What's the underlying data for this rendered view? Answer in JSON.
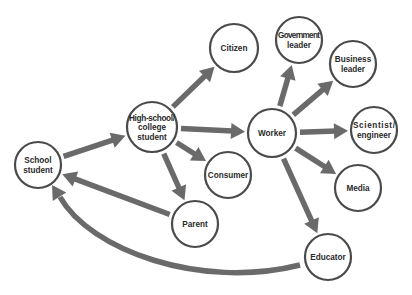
{
  "diagram": {
    "title": "",
    "colors": {
      "arrow": "#6a6a6a",
      "node_stroke": "#4a4a4a",
      "node_fill": "#ffffff",
      "text": "#2a2a2a"
    },
    "nodes": [
      {
        "id": "school_student",
        "lines": [
          "School",
          "student"
        ],
        "cx": 38,
        "cy": 165,
        "r": 23
      },
      {
        "id": "hs_college_student",
        "lines": [
          "High-school/",
          "college",
          "student"
        ],
        "cx": 152,
        "cy": 127,
        "r": 25
      },
      {
        "id": "citizen",
        "lines": [
          "Citizen"
        ],
        "cx": 234,
        "cy": 48,
        "r": 24
      },
      {
        "id": "government_leader",
        "lines": [
          "Government",
          "leader"
        ],
        "cx": 299,
        "cy": 40,
        "r": 23
      },
      {
        "id": "business_leader",
        "lines": [
          "Business",
          "leader"
        ],
        "cx": 353,
        "cy": 64,
        "r": 23
      },
      {
        "id": "worker",
        "lines": [
          "Worker"
        ],
        "cx": 272,
        "cy": 133,
        "r": 24
      },
      {
        "id": "scientist_engineer",
        "lines": [
          "Scientist/",
          "engineer"
        ],
        "cx": 374,
        "cy": 130,
        "r": 23
      },
      {
        "id": "consumer",
        "lines": [
          "Consumer"
        ],
        "cx": 228,
        "cy": 175,
        "r": 23
      },
      {
        "id": "media",
        "lines": [
          "Media"
        ],
        "cx": 358,
        "cy": 188,
        "r": 23
      },
      {
        "id": "parent",
        "lines": [
          "Parent"
        ],
        "cx": 195,
        "cy": 224,
        "r": 23
      },
      {
        "id": "educator",
        "lines": [
          "Educator"
        ],
        "cx": 328,
        "cy": 257,
        "r": 23
      }
    ],
    "edges": [
      {
        "from": "school_student",
        "to": "hs_college_student"
      },
      {
        "from": "hs_college_student",
        "to": "citizen"
      },
      {
        "from": "hs_college_student",
        "to": "worker"
      },
      {
        "from": "hs_college_student",
        "to": "consumer"
      },
      {
        "from": "hs_college_student",
        "to": "parent"
      },
      {
        "from": "worker",
        "to": "government_leader"
      },
      {
        "from": "worker",
        "to": "business_leader"
      },
      {
        "from": "worker",
        "to": "scientist_engineer"
      },
      {
        "from": "worker",
        "to": "media"
      },
      {
        "from": "worker",
        "to": "educator"
      },
      {
        "from": "parent",
        "to": "school_student"
      },
      {
        "from": "educator",
        "to": "school_student",
        "curved": true
      }
    ]
  }
}
